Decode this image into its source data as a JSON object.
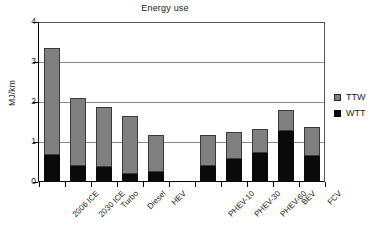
{
  "chart_data": {
    "type": "bar",
    "title": "Energy use",
    "xlabel": "",
    "ylabel": "MJ/km",
    "ylim": [
      0,
      4
    ],
    "yticks": [
      0,
      1,
      2,
      3,
      4
    ],
    "grid": true,
    "stacked": true,
    "legend_position": "right",
    "categories": [
      "2006 ICE",
      "2030 ICE",
      "Turbo",
      "Diesel",
      "HEV",
      "",
      "PHEV-10",
      "PHEV-30",
      "PHEV-60",
      "BEV",
      "FCV"
    ],
    "series": [
      {
        "name": "WTT",
        "color": "#0a0a0a",
        "values": [
          0.67,
          0.41,
          0.38,
          0.21,
          0.24,
          null,
          0.39,
          0.58,
          0.73,
          1.27,
          0.65
        ]
      },
      {
        "name": "TTW",
        "color": "#808080",
        "values": [
          2.68,
          1.68,
          1.5,
          1.44,
          0.94,
          null,
          0.78,
          0.67,
          0.6,
          0.53,
          0.72
        ]
      }
    ],
    "totals": [
      3.35,
      2.09,
      1.88,
      1.65,
      1.18,
      null,
      1.17,
      1.25,
      1.33,
      1.8,
      1.37
    ]
  },
  "legend": {
    "entries": [
      {
        "label": "TTW",
        "color": "#808080"
      },
      {
        "label": "WTT",
        "color": "#0a0a0a"
      }
    ]
  }
}
